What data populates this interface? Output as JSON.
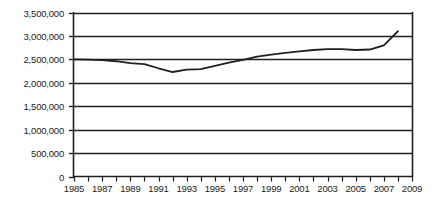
{
  "chart_data": {
    "type": "line",
    "title": "",
    "xlabel": "",
    "ylabel": "",
    "xlim": [
      1985,
      2009
    ],
    "ylim": [
      0,
      3500000
    ],
    "grid": true,
    "legend": false,
    "y_ticks": [
      0,
      500000,
      1000000,
      1500000,
      2000000,
      2500000,
      3000000,
      3500000
    ],
    "y_tick_labels": [
      "0",
      "500,000",
      "1,000,000",
      "1,500,000",
      "2,000,000",
      "2,500,000",
      "3,000,000",
      "3,500,000"
    ],
    "x_ticks": [
      1985,
      1986,
      1987,
      1988,
      1989,
      1990,
      1991,
      1992,
      1993,
      1994,
      1995,
      1996,
      1997,
      1998,
      1999,
      2000,
      2001,
      2002,
      2003,
      2004,
      2005,
      2006,
      2007,
      2008,
      2009
    ],
    "x_tick_labels_visible": [
      "1985",
      "1987",
      "1989",
      "1991",
      "1993",
      "1995",
      "1997",
      "1999",
      "2001",
      "2003",
      "2005",
      "2007",
      "2009"
    ],
    "x": [
      1985,
      1986,
      1987,
      1988,
      1989,
      1990,
      1991,
      1992,
      1993,
      1994,
      1995,
      1996,
      1997,
      1998,
      1999,
      2000,
      2001,
      2002,
      2003,
      2004,
      2005,
      2006,
      2007,
      2008
    ],
    "values": [
      2500000,
      2495000,
      2485000,
      2460000,
      2420000,
      2400000,
      2310000,
      2230000,
      2280000,
      2290000,
      2360000,
      2430000,
      2490000,
      2560000,
      2600000,
      2640000,
      2670000,
      2700000,
      2720000,
      2720000,
      2700000,
      2710000,
      2800000,
      3100000
    ],
    "series_color": "#231f20",
    "line_width": 1.8,
    "axis_color": "#231f20"
  },
  "axis": {
    "y_label_0": "0",
    "y_label_1": "500,000",
    "y_label_2": "1,000,000",
    "y_label_3": "1,500,000",
    "y_label_4": "2,000,000",
    "y_label_5": "2,500,000",
    "y_label_6": "3,000,000",
    "y_label_7": "3,500,000",
    "x_label_1985": "1985",
    "x_label_1987": "1987",
    "x_label_1989": "1989",
    "x_label_1991": "1991",
    "x_label_1993": "1993",
    "x_label_1995": "1995",
    "x_label_1997": "1997",
    "x_label_1999": "1999",
    "x_label_2001": "2001",
    "x_label_2003": "2003",
    "x_label_2005": "2005",
    "x_label_2007": "2007",
    "x_label_2009": "2009"
  }
}
